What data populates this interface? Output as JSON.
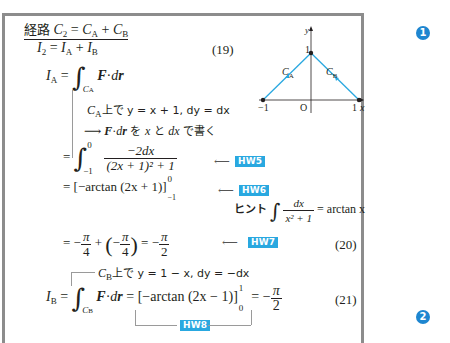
{
  "heading": {
    "prefix": "経路",
    "formula": "C₂ = C_A + C_B"
  },
  "eq19": {
    "text": "I₂ = I_A + I_B",
    "number": "(19)"
  },
  "ia_def": {
    "lhs": "I",
    "lhs_sub": "A",
    "integral_sub": "C",
    "integral_sub2": "A",
    "integrand": "F·dr"
  },
  "note1": {
    "text": "上で y = x + 1,  dy = dx",
    "prefix_var": "C",
    "prefix_sub": "A"
  },
  "note2": {
    "arrow": "⟶",
    "text1": "F·dr",
    "text2": " を x と dx で書く"
  },
  "step1": {
    "lower": "−1",
    "upper": "0",
    "numerator": "−2dx",
    "denominator": "(2x + 1)² + 1",
    "badge": "HW5"
  },
  "step2": {
    "text": "= [−arctan (2x + 1)]",
    "upper": "0",
    "lower": "−1",
    "badge": "HW6"
  },
  "hint": {
    "label": "ヒント",
    "numerator": "dx",
    "denominator": "x² + 1",
    "rhs": "= arctan x"
  },
  "eq20": {
    "text": "= −π/4 + (−π/4) = −π/2",
    "badge": "HW7",
    "number": "(20)"
  },
  "note3": {
    "prefix_var": "C",
    "prefix_sub": "B",
    "text": "上で y = 1 − x,  dy = −dx"
  },
  "eq21": {
    "lhs": "I",
    "lhs_sub": "B",
    "integral_sub": "C",
    "integral_sub2": "B",
    "integrand": "F·dr",
    "rhs": "[−arctan (2x − 1)]",
    "upper": "1",
    "lower": "0",
    "result": "= −π/2",
    "number": "(21)",
    "badge": "HW8"
  },
  "graph": {
    "x_label": "x",
    "y_label": "y",
    "origin": "O",
    "tick_neg1": "−1",
    "tick_pos1": "1",
    "tick_y1": "1",
    "curve_a": "C",
    "curve_a_sub": "A",
    "curve_b": "C",
    "curve_b_sub": "B",
    "line_color": "#29a8e0"
  },
  "badges": [
    "1",
    "2"
  ],
  "colors": {
    "accent": "#29a8e0",
    "badge": "#1e86d0",
    "border": "#8c8c8c"
  }
}
